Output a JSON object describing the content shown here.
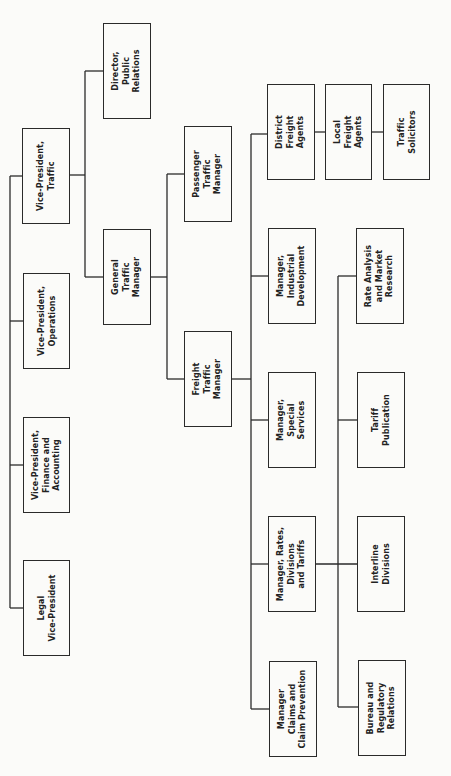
{
  "diagram": {
    "type": "organization-chart",
    "orientation": "rotated-90-ccw",
    "line_color": "#2a2a2a",
    "box_border_color": "#2a2a2a",
    "background": "#fbfbf9",
    "nodes": [
      {
        "id": "vp_traffic",
        "label": "Vice-President,\nTraffic",
        "x": 22,
        "y": 128,
        "w": 48,
        "h": 96
      },
      {
        "id": "vp_operations",
        "label": "Vice-President,\nOperations",
        "x": 23,
        "y": 273,
        "w": 47,
        "h": 96
      },
      {
        "id": "vp_finance",
        "label": "Vice-President,\nFinance and\nAccounting",
        "x": 23,
        "y": 417,
        "w": 47,
        "h": 96
      },
      {
        "id": "legal_vp",
        "label": "Legal\nVice-President",
        "x": 23,
        "y": 560,
        "w": 47,
        "h": 96
      },
      {
        "id": "director_pr",
        "label": "Director,\nPublic\nRelations",
        "x": 103,
        "y": 23,
        "w": 48,
        "h": 96
      },
      {
        "id": "general_traffic_mgr",
        "label": "General\nTraffic\nManager",
        "x": 103,
        "y": 229,
        "w": 48,
        "h": 96
      },
      {
        "id": "passenger_traffic_mgr",
        "label": "Passenger\nTraffic\nManager",
        "x": 184,
        "y": 126,
        "w": 48,
        "h": 96
      },
      {
        "id": "freight_traffic_mgr",
        "label": "Freight\nTraffic\nManager",
        "x": 184,
        "y": 331,
        "w": 48,
        "h": 96
      },
      {
        "id": "district_freight_agents",
        "label": "District\nFreight\nAgents",
        "x": 267,
        "y": 84,
        "w": 48,
        "h": 96
      },
      {
        "id": "local_freight_agents",
        "label": "Local\nFreight\nAgents",
        "x": 325,
        "y": 84,
        "w": 47,
        "h": 96
      },
      {
        "id": "traffic_solicitors",
        "label": "Traffic\nSolicitors",
        "x": 383,
        "y": 84,
        "w": 47,
        "h": 96
      },
      {
        "id": "mgr_industrial_dev",
        "label": "Manager,\nIndustrial\nDevelopment",
        "x": 268,
        "y": 228,
        "w": 48,
        "h": 96
      },
      {
        "id": "mgr_special_services",
        "label": "Manager,\nSpecial\nServices",
        "x": 268,
        "y": 372,
        "w": 48,
        "h": 96
      },
      {
        "id": "mgr_rates_divisions_tariffs",
        "label": "Manager, Rates,\nDivisions\nand Tariffs",
        "x": 268,
        "y": 516,
        "w": 48,
        "h": 96
      },
      {
        "id": "mgr_claims",
        "label": "Manager\nClaims and\nClaim Prevention",
        "x": 269,
        "y": 661,
        "w": 48,
        "h": 96
      },
      {
        "id": "rate_analysis",
        "label": "Rate Analysis\nand Market\nResearch",
        "x": 356,
        "y": 228,
        "w": 48,
        "h": 96
      },
      {
        "id": "tariff_publication",
        "label": "Tariff\nPublication",
        "x": 357,
        "y": 372,
        "w": 48,
        "h": 96
      },
      {
        "id": "interline_divisions",
        "label": "Interline\nDivisions",
        "x": 357,
        "y": 516,
        "w": 48,
        "h": 96
      },
      {
        "id": "bureau_regulatory",
        "label": "Bureau and\nRegulatory\nRelations",
        "x": 358,
        "y": 660,
        "w": 48,
        "h": 96
      }
    ],
    "edges": [
      [
        "vp_traffic",
        "vp_operations"
      ],
      [
        "vp_traffic",
        "vp_finance"
      ],
      [
        "vp_traffic",
        "legal_vp"
      ],
      [
        "vp_traffic",
        "director_pr"
      ],
      [
        "vp_traffic",
        "general_traffic_mgr"
      ],
      [
        "general_traffic_mgr",
        "passenger_traffic_mgr"
      ],
      [
        "general_traffic_mgr",
        "freight_traffic_mgr"
      ],
      [
        "freight_traffic_mgr",
        "district_freight_agents"
      ],
      [
        "freight_traffic_mgr",
        "mgr_industrial_dev"
      ],
      [
        "freight_traffic_mgr",
        "mgr_special_services"
      ],
      [
        "freight_traffic_mgr",
        "mgr_rates_divisions_tariffs"
      ],
      [
        "freight_traffic_mgr",
        "mgr_claims"
      ],
      [
        "district_freight_agents",
        "local_freight_agents"
      ],
      [
        "local_freight_agents",
        "traffic_solicitors"
      ],
      [
        "mgr_rates_divisions_tariffs",
        "rate_analysis"
      ],
      [
        "mgr_rates_divisions_tariffs",
        "tariff_publication"
      ],
      [
        "mgr_rates_divisions_tariffs",
        "interline_divisions"
      ],
      [
        "mgr_rates_divisions_tariffs",
        "bureau_regulatory"
      ]
    ],
    "line_segments": [
      [
        10,
        176,
        22,
        176
      ],
      [
        10,
        176,
        10,
        608
      ],
      [
        10,
        321,
        23,
        321
      ],
      [
        10,
        465,
        23,
        465
      ],
      [
        10,
        608,
        23,
        608
      ],
      [
        70,
        175,
        85,
        175
      ],
      [
        85,
        71,
        85,
        277
      ],
      [
        85,
        71,
        103,
        71
      ],
      [
        85,
        277,
        103,
        277
      ],
      [
        151,
        277,
        167,
        277
      ],
      [
        167,
        174,
        167,
        379
      ],
      [
        167,
        174,
        184,
        174
      ],
      [
        167,
        379,
        184,
        379
      ],
      [
        232,
        379,
        251,
        379
      ],
      [
        251,
        134,
        251,
        709
      ],
      [
        251,
        134,
        267,
        134
      ],
      [
        251,
        276,
        268,
        276
      ],
      [
        251,
        420,
        268,
        420
      ],
      [
        251,
        564,
        268,
        564
      ],
      [
        251,
        709,
        269,
        709
      ],
      [
        315,
        132,
        325,
        132
      ],
      [
        372,
        132,
        383,
        132
      ],
      [
        316,
        564,
        357,
        564
      ],
      [
        338,
        276,
        338,
        707
      ],
      [
        338,
        276,
        356,
        276
      ],
      [
        338,
        420,
        357,
        420
      ],
      [
        338,
        707,
        358,
        707
      ]
    ]
  }
}
